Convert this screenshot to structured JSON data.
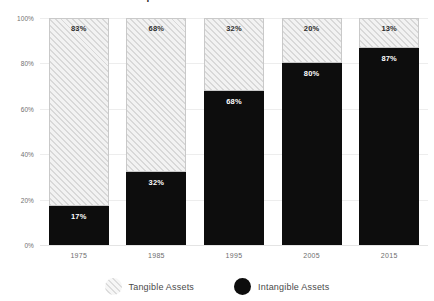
{
  "chart_data": {
    "type": "bar",
    "title": "Components of S&P 500 Market Value",
    "xlabel": "",
    "ylabel": "",
    "ylim": [
      0,
      100
    ],
    "stacked": true,
    "stacked_percent": true,
    "grid": true,
    "legend_position": "bottom",
    "categories": [
      "1975",
      "1985",
      "1995",
      "2005",
      "2015"
    ],
    "ytick_labels": [
      "100%",
      "80%",
      "60%",
      "40%",
      "20%",
      "0%"
    ],
    "ytick_values": [
      100,
      80,
      60,
      40,
      20,
      0
    ],
    "series": [
      {
        "name": "Tangible Assets",
        "style": "hatched",
        "color": "#E8E8E8",
        "values": [
          83,
          68,
          32,
          20,
          13
        ],
        "labels": [
          "83%",
          "68%",
          "32%",
          "20%",
          "13%"
        ]
      },
      {
        "name": "Intangible Assets",
        "style": "solid",
        "color": "#0D0D0D",
        "values": [
          17,
          32,
          68,
          80,
          87
        ],
        "labels": [
          "17%",
          "32%",
          "68%",
          "80%",
          "87%"
        ]
      }
    ]
  },
  "legend": {
    "items": [
      {
        "label": "Tangible Assets",
        "marker": "hatched-circle-icon"
      },
      {
        "label": "Intangible Assets",
        "marker": "solid-circle-icon"
      }
    ]
  },
  "colors": {
    "background": "#FFFFFF",
    "intangible": "#0D0D0D",
    "tangible_fill": "#EDEDED",
    "tangible_hatch": "#D8D8D8",
    "gridline": "#EDEDED",
    "axis_text": "#6E6E6E"
  }
}
